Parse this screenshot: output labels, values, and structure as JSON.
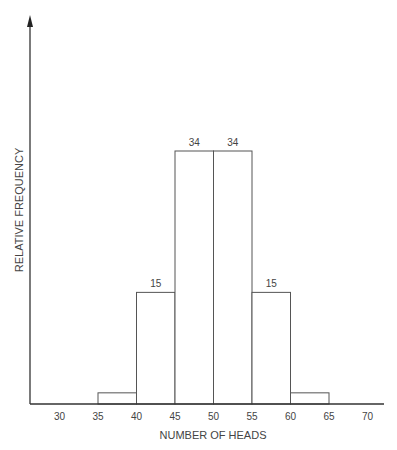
{
  "chart_data": {
    "type": "bar",
    "title": "",
    "xlabel": "NUMBER OF HEADS",
    "ylabel": "RELATIVE FREQUENCY",
    "x_ticks": [
      "30",
      "35",
      "40",
      "45",
      "50",
      "55",
      "60",
      "65",
      "70"
    ],
    "bins": [
      {
        "from": 35,
        "to": 40,
        "value": 1.5,
        "label": ""
      },
      {
        "from": 40,
        "to": 45,
        "value": 15,
        "label": "15"
      },
      {
        "from": 45,
        "to": 50,
        "value": 34,
        "label": "34"
      },
      {
        "from": 50,
        "to": 55,
        "value": 34,
        "label": "34"
      },
      {
        "from": 55,
        "to": 60,
        "value": 15,
        "label": "15"
      },
      {
        "from": 60,
        "to": 65,
        "value": 1.5,
        "label": ""
      }
    ],
    "categories": [
      "35-40",
      "40-45",
      "45-50",
      "50-55",
      "55-60",
      "60-65"
    ],
    "values": [
      1.5,
      15,
      34,
      34,
      15,
      1.5
    ],
    "xlim": [
      26,
      72
    ],
    "grid": false,
    "legend": null
  }
}
